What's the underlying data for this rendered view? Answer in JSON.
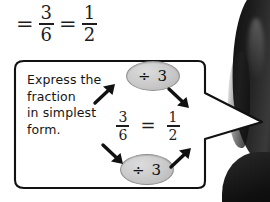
{
  "page": {
    "background_color": "#ffffff",
    "ink_color": "#151515"
  },
  "top_expression": {
    "name": "simplify-result-line",
    "equals_1": "=",
    "fraction_1": {
      "numerator": "3",
      "denominator": "6"
    },
    "equals_2": "=",
    "fraction_2": {
      "numerator": "1",
      "denominator": "2"
    }
  },
  "speech_bubble": {
    "instruction_lines": [
      "Express the",
      "fraction",
      "in simplest",
      "form."
    ],
    "equation": {
      "left_fraction": {
        "numerator": "3",
        "denominator": "6"
      },
      "equals": "=",
      "right_fraction": {
        "numerator": "1",
        "denominator": "2"
      }
    },
    "operation_badges": [
      {
        "id": "divide-by-3-top",
        "label": "÷ 3",
        "fill_color": "#c9c9c9"
      },
      {
        "id": "divide-by-3-bottom",
        "label": "÷ 3",
        "fill_color": "#c9c9c9"
      }
    ],
    "arrows": [
      {
        "id": "arrow-up-right-to-top-badge",
        "direction": "up-right"
      },
      {
        "id": "arrow-down-right-from-top-badge",
        "direction": "down-right"
      },
      {
        "id": "arrow-down-right-to-bottom-badge",
        "direction": "down-right"
      },
      {
        "id": "arrow-up-right-from-bottom-badge",
        "direction": "up-right"
      }
    ],
    "border_color": "#111111",
    "fill_color": "#ffffff"
  },
  "speaker": {
    "description": "person with dark hair at right edge",
    "hair_color": "#141414"
  }
}
